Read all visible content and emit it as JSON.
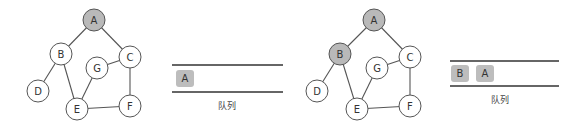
{
  "colors": {
    "visited_fill": "#b9b9b9",
    "unvisited_fill": "#ffffff",
    "stroke": "#555555",
    "queue_item_fill": "#bdbdbd",
    "queue_line": "#333333"
  },
  "panels": [
    {
      "graph": {
        "nodes": [
          {
            "id": "A",
            "label": "A",
            "x": 94,
            "y": 20,
            "visited": true
          },
          {
            "id": "B",
            "label": "B",
            "x": 61,
            "y": 54,
            "visited": false
          },
          {
            "id": "C",
            "label": "C",
            "x": 130,
            "y": 57,
            "visited": false
          },
          {
            "id": "G",
            "label": "G",
            "x": 97,
            "y": 68,
            "visited": false
          },
          {
            "id": "D",
            "label": "D",
            "x": 38,
            "y": 91,
            "visited": false
          },
          {
            "id": "E",
            "label": "E",
            "x": 77,
            "y": 109,
            "visited": false
          },
          {
            "id": "F",
            "label": "F",
            "x": 130,
            "y": 106,
            "visited": false
          }
        ],
        "edges": [
          [
            "A",
            "B"
          ],
          [
            "A",
            "C"
          ],
          [
            "B",
            "D"
          ],
          [
            "B",
            "E"
          ],
          [
            "G",
            "C"
          ],
          [
            "G",
            "E"
          ],
          [
            "C",
            "F"
          ],
          [
            "E",
            "F"
          ]
        ]
      },
      "queue": {
        "x1": 172,
        "x2": 283,
        "top": 65,
        "bottom": 92,
        "items": [
          {
            "label": "A",
            "x": 176
          }
        ],
        "caption": "队列",
        "caption_x": 227
      }
    },
    {
      "graph": {
        "nodes": [
          {
            "id": "A",
            "label": "A",
            "x": 374,
            "y": 20,
            "visited": true
          },
          {
            "id": "B",
            "label": "B",
            "x": 340,
            "y": 54,
            "visited": true
          },
          {
            "id": "C",
            "label": "C",
            "x": 410,
            "y": 57,
            "visited": false
          },
          {
            "id": "G",
            "label": "G",
            "x": 377,
            "y": 68,
            "visited": false
          },
          {
            "id": "D",
            "label": "D",
            "x": 317,
            "y": 91,
            "visited": false
          },
          {
            "id": "E",
            "label": "E",
            "x": 357,
            "y": 109,
            "visited": false
          },
          {
            "id": "F",
            "label": "F",
            "x": 410,
            "y": 106,
            "visited": false
          }
        ],
        "edges": [
          [
            "A",
            "B"
          ],
          [
            "A",
            "C"
          ],
          [
            "B",
            "D"
          ],
          [
            "B",
            "E"
          ],
          [
            "G",
            "C"
          ],
          [
            "G",
            "E"
          ],
          [
            "C",
            "F"
          ],
          [
            "E",
            "F"
          ]
        ]
      },
      "queue": {
        "x1": 450,
        "x2": 559,
        "top": 61,
        "bottom": 86,
        "items": [
          {
            "label": "B",
            "x": 451
          },
          {
            "label": "A",
            "x": 476
          }
        ],
        "caption": "队列",
        "caption_x": 500
      }
    }
  ]
}
